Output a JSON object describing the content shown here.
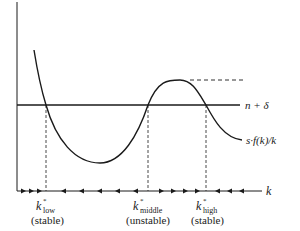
{
  "diagram": {
    "type": "solow-model-multiple-equilibria",
    "x_axis_label": "k",
    "lines": {
      "depreciation_line": "n + δ",
      "savings_curve": "s·f(k)/k"
    },
    "equilibria": [
      {
        "symbol": "k",
        "superscript": "*",
        "subscript": "low",
        "stability": "(stable)"
      },
      {
        "symbol": "k",
        "superscript": "*",
        "subscript": "middle",
        "stability": "(unstable)"
      },
      {
        "symbol": "k",
        "superscript": "*",
        "subscript": "high",
        "stability": "(stable)"
      }
    ],
    "arrows": {
      "left_of_low": "right",
      "between_low_and_middle": "left",
      "between_middle_and_high": "right",
      "right_of_high": "left"
    },
    "colors": {
      "ink": "#1a1a1a",
      "background": "#ffffff"
    }
  }
}
